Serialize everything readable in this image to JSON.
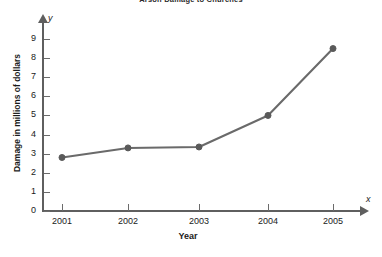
{
  "chart_data": {
    "type": "line",
    "title": "Arson Damage to Churches",
    "xlabel": "Year",
    "ylabel": "Damage in millions of dollars",
    "x_axis_symbol": "x",
    "y_axis_symbol": "y",
    "categories": [
      "2001",
      "2002",
      "2003",
      "2004",
      "2005"
    ],
    "values": [
      2.8,
      3.3,
      3.35,
      5.0,
      8.5
    ],
    "series": [
      {
        "name": "Damage",
        "values": [
          2.8,
          3.3,
          3.35,
          5.0,
          8.5
        ],
        "color": "#6a6a6a"
      }
    ],
    "ylim": [
      0,
      9
    ],
    "xlim": [
      2000.5,
      2005.6
    ],
    "y_ticks": [
      0,
      1,
      2,
      3,
      4,
      5,
      6,
      7,
      8,
      9
    ],
    "y_tick_labels": [
      "0",
      "1",
      "2",
      "3",
      "4",
      "5",
      "6",
      "7",
      "8",
      "9"
    ],
    "x_tick_labels": [
      "2001",
      "2002",
      "2003",
      "2004",
      "2005"
    ],
    "grid": false,
    "legend": false,
    "legend_position": "none",
    "marker": "circle",
    "line_color": "#6a6a6a",
    "marker_color": "#5a5a5a",
    "axis_color": "#5f5f5f",
    "background_color": "#ffffff"
  }
}
